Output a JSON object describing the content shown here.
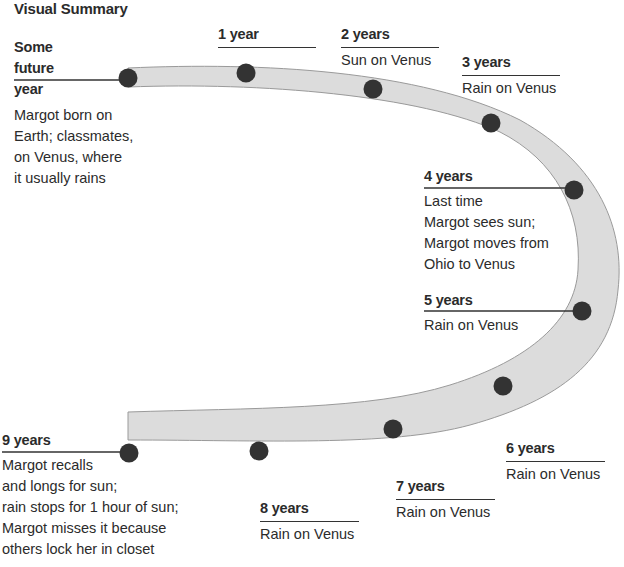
{
  "title": "Visual Summary",
  "colors": {
    "band_fill": "#dcdcdc",
    "band_stroke": "#9a9a9a",
    "dot": "#333333",
    "text": "#2b2b2b"
  },
  "events": [
    {
      "time": "Some future year",
      "time_lines": [
        "Some",
        "future year"
      ],
      "desc": "Margot born on\nEarth; classmates,\non Venus, where\nit usually rains"
    },
    {
      "time": "1 year",
      "desc": ""
    },
    {
      "time": "2 years",
      "desc": "Sun on Venus"
    },
    {
      "time": "3 years",
      "desc": "Rain on Venus"
    },
    {
      "time": "4 years",
      "desc": "Last time\nMargot sees sun;\nMargot moves from\nOhio to Venus"
    },
    {
      "time": "5 years",
      "desc": "Rain on Venus"
    },
    {
      "time": "6 years",
      "desc": "Rain on Venus"
    },
    {
      "time": "7 years",
      "desc": "Rain on Venus"
    },
    {
      "time": "8 years",
      "desc": "Rain on Venus"
    },
    {
      "time": "9 years",
      "desc": "Margot recalls\nand longs for sun;\nrain stops for 1 hour of sun;\nMargot misses it because\nothers lock her in closet"
    }
  ]
}
